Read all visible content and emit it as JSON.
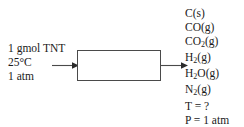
{
  "diagram": {
    "line_color": "#4a4a4a",
    "text_color": "#1a1a1a",
    "background": "#ffffff"
  },
  "inlet": {
    "lines": [
      "1 gmol TNT",
      "25°C",
      "1 atm"
    ],
    "feed_amount": "1 gmol TNT",
    "temperature": "25°C",
    "pressure": "1 atm"
  },
  "reactor": {
    "label": ""
  },
  "arrows": {
    "inlet_arrow": "arrow-right",
    "outlet_arrow": "arrow-right"
  },
  "outlet": {
    "species": [
      {
        "formula": "C",
        "sub": "",
        "state": "(s)"
      },
      {
        "formula": "CO",
        "sub": "",
        "state": "(g)"
      },
      {
        "formula": "CO",
        "sub": "2",
        "state": "(g)"
      },
      {
        "formula": "H",
        "sub": "2",
        "state": "(g)"
      },
      {
        "formula": "H",
        "sub": "2",
        "suffix": "O",
        "state": "(g)"
      },
      {
        "formula": "N",
        "sub": "2",
        "state": "(g)"
      }
    ],
    "conditions": [
      "T = ?",
      "P = 1 atm"
    ],
    "temperature": "T = ?",
    "pressure": "P = 1 atm"
  }
}
